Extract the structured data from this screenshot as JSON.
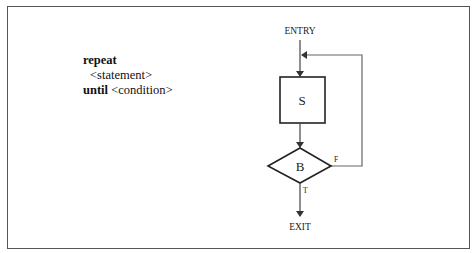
{
  "pseudocode": {
    "line1_keyword": "repeat",
    "line2_text": "<statement>",
    "line3_keyword": "until",
    "line3_text": " <condition>"
  },
  "flowchart": {
    "entry_label": "ENTRY",
    "statement_label": "S",
    "condition_label": "B",
    "false_label": "F",
    "true_label": "T",
    "exit_label": "EXIT"
  }
}
